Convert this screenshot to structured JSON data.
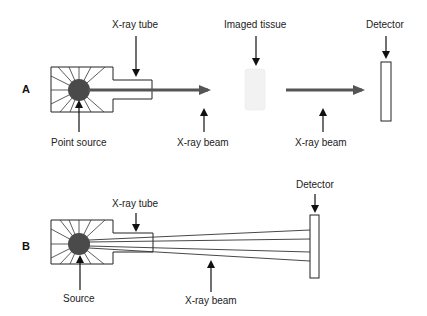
{
  "panels": {
    "a": {
      "letter": "A",
      "labels": {
        "tube": "X-ray tube",
        "point_source": "Point source",
        "beam1": "X-ray beam",
        "tissue": "Imaged tissue",
        "beam2": "X-ray beam",
        "detector": "Detector"
      }
    },
    "b": {
      "letter": "B",
      "labels": {
        "tube": "X-ray tube",
        "source": "Source",
        "beam": "X-ray beam",
        "detector": "Detector"
      }
    }
  },
  "colors": {
    "stroke": "#222222",
    "source": "#4a4a4a",
    "beam": "#555555",
    "tissue": "#f2f2f2"
  }
}
